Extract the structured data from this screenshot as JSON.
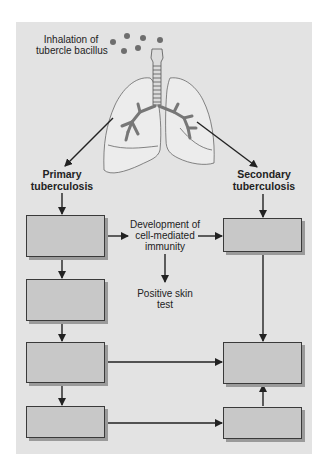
{
  "diagram": {
    "title_label": [
      "Inhalation of",
      "tubercle bacillus"
    ],
    "primary": {
      "label_line1": "Primary",
      "label_line2": "tuberculosis"
    },
    "secondary": {
      "label_line1": "Secondary",
      "label_line2": "tuberculosis"
    },
    "immunity": {
      "line1": "Development of",
      "line2": "cell-mediated",
      "line3": "immunity"
    },
    "skin_test": {
      "line1": "Positive skin",
      "line2": "test"
    },
    "left_boxes": [
      {
        "label": ""
      },
      {
        "label": ""
      },
      {
        "label": ""
      },
      {
        "label": ""
      }
    ],
    "right_boxes": [
      {
        "label": ""
      },
      {
        "label": ""
      },
      {
        "label": ""
      }
    ],
    "colors": {
      "panel_bg": "#e3e3e3",
      "box_fill": "#c8c8c8",
      "line": "#2a2a2a",
      "bacillus_dot": "#6e6e6e"
    }
  }
}
